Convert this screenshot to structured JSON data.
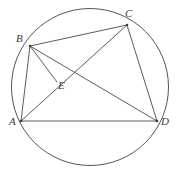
{
  "figure": {
    "background_color": "#ffffff",
    "stroke_color": "#4a4a4a",
    "circle_color": "#555555",
    "label_color": "#3a3a3a",
    "canvas": {
      "width": 180,
      "height": 187
    }
  },
  "circle": {
    "name": "circumscribed-circle",
    "cx": 90,
    "cy": 87,
    "r": 78.5
  },
  "points": [
    {
      "id": "A",
      "label": "A",
      "x": 21,
      "y": 121,
      "label_x": 9,
      "label_y": 116
    },
    {
      "id": "B",
      "label": "B",
      "x": 30,
      "y": 46,
      "label_x": 16,
      "label_y": 33
    },
    {
      "id": "C",
      "label": "C",
      "x": 127,
      "y": 25,
      "label_x": 125,
      "label_y": 8
    },
    {
      "id": "D",
      "label": "D",
      "x": 157,
      "y": 121,
      "label_x": 161,
      "label_y": 116
    },
    {
      "id": "E",
      "label": "E",
      "x": 57,
      "y": 82,
      "label_x": 58,
      "label_y": 80
    }
  ],
  "segments": [
    {
      "id": "AB",
      "from": "A",
      "to": "B",
      "kind": "side"
    },
    {
      "id": "BC",
      "from": "B",
      "to": "C",
      "kind": "side"
    },
    {
      "id": "CD",
      "from": "C",
      "to": "D",
      "kind": "side"
    },
    {
      "id": "AD",
      "from": "A",
      "to": "D",
      "kind": "side"
    },
    {
      "id": "AC",
      "from": "A",
      "to": "C",
      "kind": "diagonal"
    },
    {
      "id": "BD",
      "from": "B",
      "to": "D",
      "kind": "diagonal"
    },
    {
      "id": "BE",
      "from": "B",
      "to": "E",
      "kind": "cevian"
    }
  ]
}
